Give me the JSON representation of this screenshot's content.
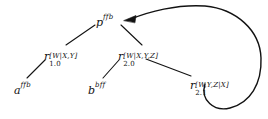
{
  "figure": {
    "background": "#ffffff",
    "stroke": "#121212",
    "width": 268,
    "height": 119
  },
  "nodes": {
    "root": {
      "id": "p",
      "base": "p",
      "superscript": "ffb",
      "subscript": "",
      "label": "p^{ffb}",
      "x": 104,
      "y": 22
    },
    "left_rule": {
      "id": "r1.0",
      "base": "r",
      "superscript": "[W|X,Y]",
      "subscript": "1.0",
      "label": "r_{1.0}^{[W|X,Y]}",
      "x": 48,
      "y": 56
    },
    "right_rule": {
      "id": "r2.0",
      "base": "r",
      "superscript": "[W|X,Y,Z]",
      "subscript": "2.0",
      "label": "r_{2.0}^{[W|X,Y,Z]}",
      "x": 122,
      "y": 56
    },
    "sub_rule": {
      "id": "r2.1",
      "base": "r",
      "superscript": "[W,Y,Z|X]",
      "subscript": "2.1",
      "label": "r_{2.1}^{[W,Y,Z|X]}",
      "x": 194,
      "y": 85
    },
    "leaf_a": {
      "id": "a",
      "base": "a",
      "superscript": "ffb",
      "subscript": "",
      "label": "a^{ffb}",
      "x": 18,
      "y": 90
    },
    "leaf_b": {
      "id": "b",
      "base": "b",
      "superscript": "bff",
      "subscript": "",
      "label": "b^{bff}",
      "x": 92,
      "y": 90
    }
  },
  "edges": [
    {
      "name": "p-to-r1.0",
      "from": "p",
      "to": "r1.0",
      "type": "line"
    },
    {
      "name": "p-to-r2.0",
      "from": "p",
      "to": "r2.0",
      "type": "line"
    },
    {
      "name": "r1.0-to-a",
      "from": "r1.0",
      "to": "a",
      "type": "line"
    },
    {
      "name": "r2.0-to-b",
      "from": "r2.0",
      "to": "b",
      "type": "line"
    },
    {
      "name": "r2.0-to-r2.1",
      "from": "r2.0",
      "to": "r2.1",
      "type": "line"
    },
    {
      "name": "r2.1-to-p",
      "from": "r2.1",
      "to": "p",
      "type": "curved-arrow",
      "arrowhead": "at-target"
    }
  ]
}
